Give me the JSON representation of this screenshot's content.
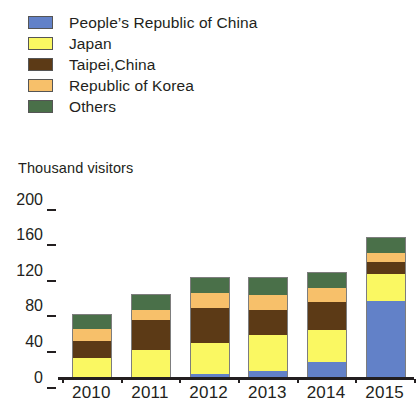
{
  "legend": {
    "items": [
      {
        "label": "People’s Republic of China",
        "color": "#6281c8",
        "key": "china"
      },
      {
        "label": "Japan",
        "color": "#faf862",
        "key": "japan"
      },
      {
        "label": "Taipei,China",
        "color": "#5c3a16",
        "key": "taipei"
      },
      {
        "label": "Republic of Korea",
        "color": "#f7c06a",
        "key": "korea"
      },
      {
        "label": "Others",
        "color": "#4a7049",
        "key": "others"
      }
    ]
  },
  "axis": {
    "y_title": "Thousand visitors",
    "y_ticks": [
      "200",
      "160",
      "120",
      "80",
      "40",
      "0"
    ],
    "x_ticks": [
      "2010",
      "2011",
      "2012",
      "2013",
      "2014",
      "2015"
    ]
  },
  "chart_data": {
    "type": "bar",
    "stacked": true,
    "title": "",
    "subtitle": "",
    "xlabel": "",
    "ylabel": "Thousand visitors",
    "ylim": [
      0,
      200
    ],
    "ytick_values": [
      0,
      40,
      80,
      120,
      160,
      200
    ],
    "grid": false,
    "legend_position": "top-left",
    "categories": [
      "2010",
      "2011",
      "2012",
      "2013",
      "2014",
      "2015"
    ],
    "series": [
      {
        "name": "People’s Republic of China",
        "color": "#6281c8",
        "values": [
          0,
          0,
          4,
          8,
          18,
          86
        ]
      },
      {
        "name": "Japan",
        "color": "#faf862",
        "values": [
          22,
          32,
          35,
          40,
          36,
          31
        ]
      },
      {
        "name": "Taipei,China",
        "color": "#5c3a16",
        "values": [
          20,
          33,
          40,
          28,
          31,
          13
        ]
      },
      {
        "name": "Republic of Korea",
        "color": "#f7c06a",
        "values": [
          13,
          11,
          16,
          17,
          16,
          11
        ]
      },
      {
        "name": "Others",
        "color": "#4a7049",
        "values": [
          17,
          18,
          19,
          21,
          18,
          18
        ]
      }
    ],
    "totals": [
      72,
      94,
      114,
      114,
      119,
      159
    ]
  }
}
